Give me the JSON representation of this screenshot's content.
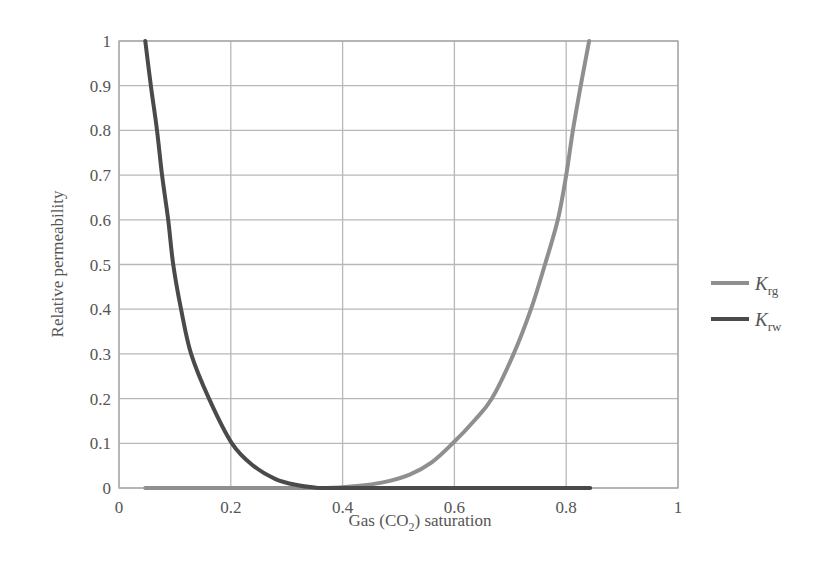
{
  "chart_data": {
    "type": "line",
    "title": "",
    "xlabel": "Gas (CO",
    "xlabel_sub": "2",
    "xlabel_tail": ") saturation",
    "ylabel": "Relative permeability",
    "xlim": [
      0,
      1
    ],
    "ylim": [
      0,
      1
    ],
    "grid": true,
    "legend_position": "right",
    "x_ticks": [
      "0",
      "0.2",
      "0.4",
      "0.6",
      "0.8",
      "1"
    ],
    "x_tick_values": [
      0,
      0.2,
      0.4,
      0.6,
      0.8,
      1
    ],
    "y_ticks": [
      "0",
      "0.1",
      "0.2",
      "0.3",
      "0.4",
      "0.5",
      "0.6",
      "0.7",
      "0.8",
      "0.9",
      "1"
    ],
    "y_tick_values": [
      0,
      0.1,
      0.2,
      0.3,
      0.4,
      0.5,
      0.6,
      0.7,
      0.8,
      0.9,
      1
    ],
    "series": [
      {
        "name": "K_rg",
        "label_main": "K",
        "label_sub": "rg",
        "color": "#8f8f8f",
        "x": [
          0.047,
          0.1,
          0.2,
          0.3,
          0.37,
          0.42,
          0.47,
          0.52,
          0.56,
          0.597,
          0.635,
          0.667,
          0.706,
          0.737,
          0.762,
          0.785,
          0.8,
          0.812,
          0.826,
          0.841
        ],
        "y": [
          0,
          0,
          0,
          0,
          0,
          0.004,
          0.012,
          0.03,
          0.058,
          0.1,
          0.15,
          0.2,
          0.3,
          0.4,
          0.5,
          0.6,
          0.7,
          0.8,
          0.9,
          1.0
        ]
      },
      {
        "name": "K_rw",
        "label_main": "K",
        "label_sub": "rw",
        "color": "#4a4a4a",
        "x": [
          0.047,
          0.057,
          0.068,
          0.077,
          0.088,
          0.097,
          0.111,
          0.129,
          0.161,
          0.202,
          0.24,
          0.28,
          0.32,
          0.35,
          0.37,
          0.5,
          0.7,
          0.843
        ],
        "y": [
          1.0,
          0.9,
          0.8,
          0.7,
          0.6,
          0.5,
          0.4,
          0.3,
          0.2,
          0.1,
          0.05,
          0.02,
          0.006,
          0.001,
          0,
          0,
          0,
          0
        ]
      }
    ]
  }
}
